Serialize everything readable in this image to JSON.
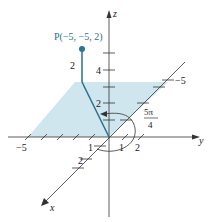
{
  "figure": {
    "colors": {
      "axis": "#333333",
      "plane_fill": "#cfe6ef",
      "point": "#2a7596",
      "segment": "#2a6f8f",
      "text": "#222222"
    },
    "axes": {
      "x_label": "x",
      "y_label": "y",
      "z_label": "z"
    },
    "point": {
      "label": "P(−5, −5, 2)",
      "coords": [
        -5,
        -5,
        2
      ],
      "height_label": "2"
    },
    "angle": {
      "numerator": "5π",
      "denominator": "4"
    },
    "ticks": {
      "z_labels": [
        "4",
        "2"
      ],
      "y_neg_label": "−5",
      "y_pos_labels": [
        "1",
        "2"
      ],
      "x_neg_label": "−5",
      "x_pos_labels": [
        "1",
        "2"
      ]
    }
  }
}
